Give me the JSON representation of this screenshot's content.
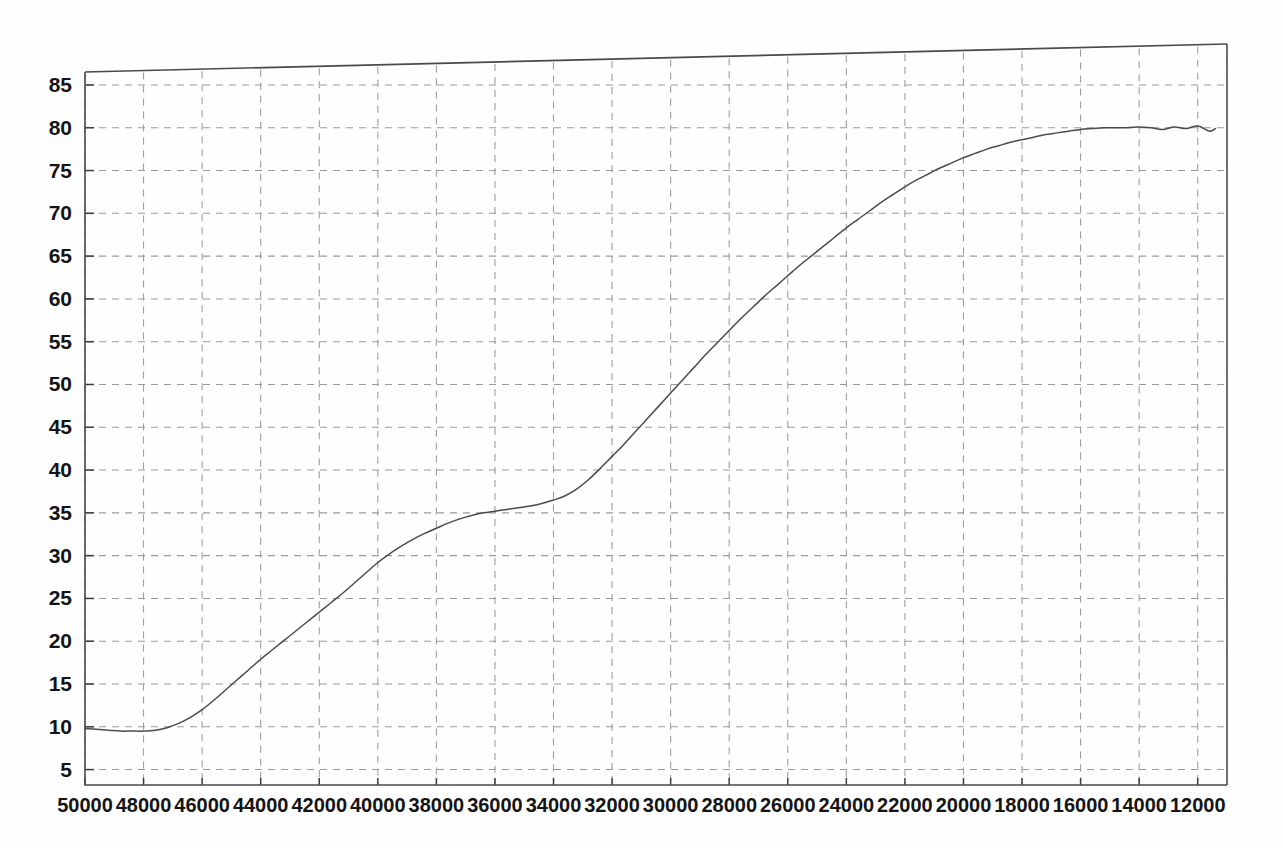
{
  "figure": {
    "background_color": "#fefefe",
    "curve_color": "#4b4b4b",
    "grid_color": "#9a9a9a",
    "axis_color": "#4a4a4a"
  },
  "chart_data": {
    "type": "line",
    "title": "",
    "subtitle": "",
    "xlabel": "",
    "ylabel": "",
    "xlim": [
      50000,
      11000
    ],
    "ylim": [
      3.2,
      88.5
    ],
    "x_axis_direction": "descending",
    "grid": true,
    "grid_style": "dashed",
    "legend": "none",
    "annotations": [],
    "xticks": [
      50000,
      48000,
      46000,
      44000,
      42000,
      40000,
      38000,
      36000,
      34000,
      32000,
      30000,
      28000,
      26000,
      24000,
      22000,
      20000,
      18000,
      16000,
      14000,
      12000
    ],
    "xtick_labels": [
      "50000",
      "48000",
      "46000",
      "44000",
      "42000",
      "40000",
      "38000",
      "36000",
      "34000",
      "32000",
      "30000",
      "28000",
      "26000",
      "24000",
      "22000",
      "20000",
      "18000",
      "16000",
      "14000",
      "12000"
    ],
    "yticks": [
      5,
      10,
      15,
      20,
      25,
      30,
      35,
      40,
      45,
      50,
      55,
      60,
      65,
      70,
      75,
      80,
      85
    ],
    "ytick_labels": [
      "5",
      "10",
      "15",
      "20",
      "25",
      "30",
      "35",
      "40",
      "45",
      "50",
      "55",
      "60",
      "65",
      "70",
      "75",
      "80",
      "85"
    ],
    "series": [
      {
        "name": "curve",
        "x": [
          50000,
          49600,
          49200,
          48800,
          48400,
          48000,
          47600,
          47200,
          46800,
          46400,
          46000,
          45600,
          45200,
          44800,
          44400,
          44000,
          43600,
          43200,
          42800,
          42400,
          42000,
          41600,
          41200,
          40800,
          40400,
          40000,
          39600,
          39200,
          38800,
          38400,
          38000,
          37600,
          37200,
          36800,
          36400,
          36000,
          35600,
          35200,
          34800,
          34400,
          34000,
          33600,
          33200,
          32800,
          32400,
          32000,
          31600,
          31200,
          30800,
          30400,
          30000,
          29600,
          29200,
          28800,
          28400,
          28000,
          27600,
          27200,
          26800,
          26400,
          26000,
          25600,
          25200,
          24800,
          24400,
          24000,
          23600,
          23200,
          22800,
          22400,
          22000,
          21600,
          21200,
          20800,
          20400,
          20000,
          19600,
          19200,
          18800,
          18400,
          18000,
          17600,
          17200,
          16800,
          16400,
          16000,
          15600,
          15200,
          14800,
          14400,
          14000,
          13600,
          13200,
          12800,
          12400,
          12000,
          11600,
          11400
        ],
        "y": [
          9.8,
          9.7,
          9.6,
          9.5,
          9.5,
          9.5,
          9.6,
          9.9,
          10.4,
          11.1,
          12.0,
          13.1,
          14.3,
          15.5,
          16.7,
          17.9,
          19.0,
          20.1,
          21.2,
          22.3,
          23.4,
          24.5,
          25.6,
          26.8,
          28.0,
          29.2,
          30.2,
          31.1,
          31.9,
          32.6,
          33.2,
          33.8,
          34.3,
          34.7,
          35.0,
          35.2,
          35.4,
          35.6,
          35.8,
          36.1,
          36.5,
          37.0,
          37.8,
          38.9,
          40.2,
          41.6,
          43.0,
          44.5,
          46.0,
          47.5,
          49.0,
          50.5,
          52.0,
          53.5,
          54.9,
          56.3,
          57.7,
          59.0,
          60.3,
          61.5,
          62.7,
          63.9,
          65.0,
          66.1,
          67.2,
          68.3,
          69.3,
          70.3,
          71.3,
          72.2,
          73.1,
          73.9,
          74.6,
          75.3,
          75.9,
          76.5,
          77.0,
          77.5,
          77.9,
          78.3,
          78.6,
          78.9,
          79.2,
          79.4,
          79.6,
          79.8,
          79.9,
          80.0,
          80.0,
          80.0,
          80.1,
          80.0,
          79.8,
          80.1,
          79.9,
          80.2,
          79.6,
          79.9
        ],
        "color": "#4b4b4b",
        "style": "solid"
      }
    ]
  }
}
